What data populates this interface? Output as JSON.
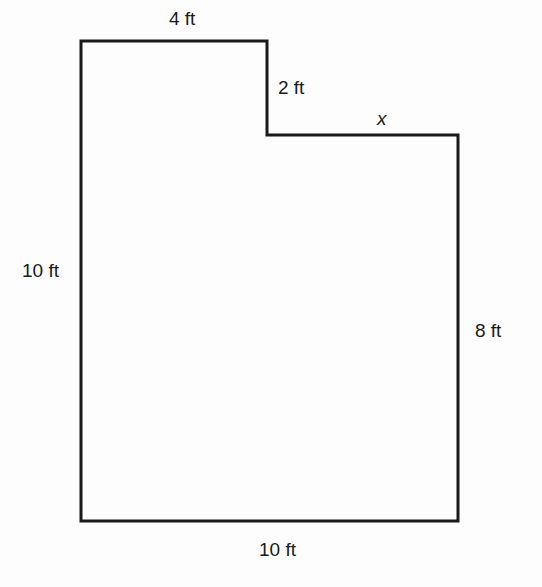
{
  "diagram": {
    "type": "composite-figure",
    "shape": "L-shaped polygon (rectangle with upper-right notch removed)",
    "stroke_color": "#1a1a1a",
    "background_color": "#ffffff",
    "vertices": [
      {
        "x": 81,
        "y": 41
      },
      {
        "x": 267,
        "y": 41
      },
      {
        "x": 267,
        "y": 135
      },
      {
        "x": 458,
        "y": 135
      },
      {
        "x": 458,
        "y": 521
      },
      {
        "x": 81,
        "y": 521
      }
    ],
    "labels": {
      "top": "4 ft",
      "step": "2 ft",
      "unknown": "x",
      "left": "10 ft",
      "right": "8 ft",
      "bottom": "10 ft"
    }
  }
}
